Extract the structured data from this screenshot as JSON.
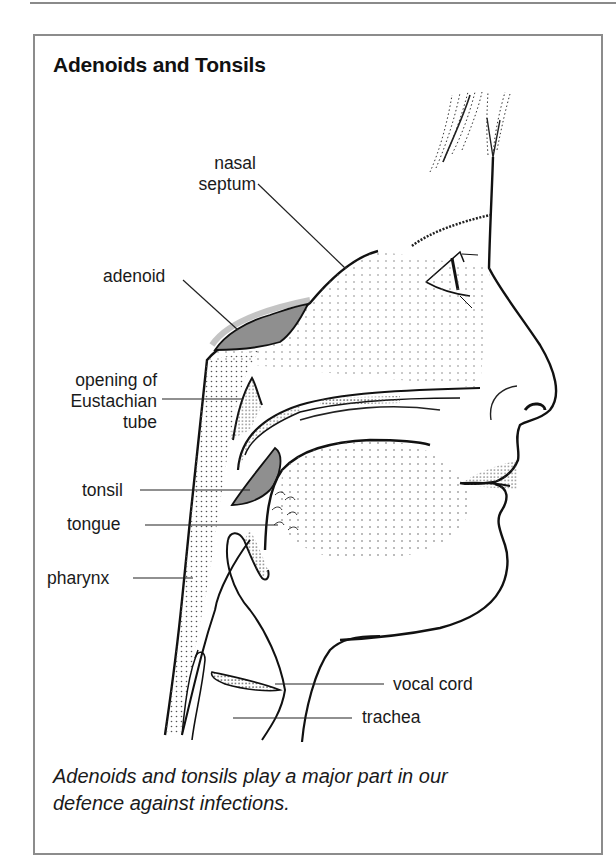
{
  "figure": {
    "title": "Adenoids and Tonsils",
    "caption_line1": "Adenoids and tonsils play a major part in our",
    "caption_line2": "defence against infections.",
    "colors": {
      "border": "#8c8c8c",
      "ink": "#1a1a1a",
      "tissue_gray": "#8f8f8f",
      "stipple": "#555555"
    }
  },
  "labels": {
    "nasal_septum_1": "nasal",
    "nasal_septum_2": "septum",
    "adenoid": "adenoid",
    "eustachian_1": "opening of",
    "eustachian_2": "Eustachian",
    "eustachian_3": "tube",
    "tonsil": "tonsil",
    "tongue": "tongue",
    "pharynx": "pharynx",
    "vocal_cord": "vocal cord",
    "trachea": "trachea"
  }
}
